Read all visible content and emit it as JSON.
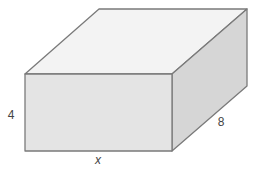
{
  "diagram": {
    "shape": "rectangular prism",
    "labels": {
      "height": "4",
      "depth": "8",
      "width": "x"
    },
    "colors": {
      "top_face": "#f3f3f3",
      "front_face": "#e4e4e4",
      "right_face": "#d6d6d6",
      "edge": "#7a7a7a",
      "label": "#444444"
    }
  }
}
